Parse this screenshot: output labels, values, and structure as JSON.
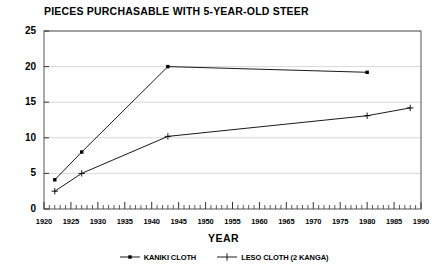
{
  "chart_data": {
    "type": "line",
    "title": "PIECES PURCHASABLE WITH 5-YEAR-OLD STEER",
    "xlabel": "YEAR",
    "ylabel": "",
    "xlim": [
      1920,
      1990
    ],
    "ylim": [
      0,
      25
    ],
    "grid": true,
    "grid_axis": "y",
    "legend_position": "bottom-center",
    "xticks": [
      1920,
      1925,
      1930,
      1935,
      1940,
      1945,
      1950,
      1955,
      1960,
      1965,
      1970,
      1975,
      1980,
      1985,
      1990
    ],
    "xtick_labels": [
      "1920",
      "1925",
      "1930",
      "1935",
      "1940",
      "1945",
      "1950",
      "1955",
      "1960",
      "1965",
      "1970",
      "1975",
      "1980",
      "1985",
      "1990"
    ],
    "x_minor_tick_interval": 1,
    "yticks": [
      0,
      5,
      10,
      15,
      20,
      25
    ],
    "ytick_labels": [
      "0",
      "5",
      "10",
      "15",
      "20",
      "25"
    ],
    "series": [
      {
        "name": "KANIKI CLOTH",
        "marker": "square",
        "color": "#000000",
        "points": [
          {
            "x": 1922,
            "y": 4.1
          },
          {
            "x": 1927,
            "y": 8.0
          },
          {
            "x": 1943,
            "y": 20.0
          },
          {
            "x": 1980,
            "y": 19.2
          }
        ]
      },
      {
        "name": "LESO CLOTH (2 KANGA)",
        "marker": "plus",
        "color": "#000000",
        "points": [
          {
            "x": 1922,
            "y": 2.5
          },
          {
            "x": 1927,
            "y": 5.0
          },
          {
            "x": 1943,
            "y": 10.2
          },
          {
            "x": 1980,
            "y": 13.1
          },
          {
            "x": 1988,
            "y": 14.2
          }
        ]
      }
    ]
  },
  "legend": {
    "entries": [
      {
        "label": "KANIKI CLOTH",
        "marker": "square"
      },
      {
        "label": "LESO CLOTH (2 KANGA)",
        "marker": "plus"
      }
    ]
  }
}
